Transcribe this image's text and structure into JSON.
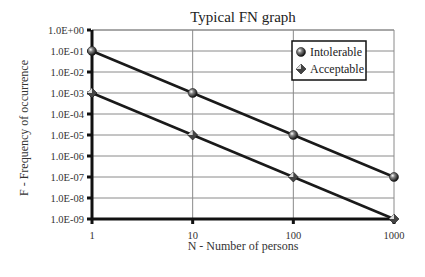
{
  "chart_data": {
    "type": "line",
    "title": "Typical FN graph",
    "xlabel": "N - Number of persons",
    "ylabel": "F - Frequency of occurrence",
    "x_scale": "log",
    "y_scale": "log",
    "x": [
      1,
      10,
      100,
      1000
    ],
    "x_tick_labels": [
      "1",
      "10",
      "100",
      "1000"
    ],
    "y_tick_labels": [
      "1.0E+00",
      "1.0E-01",
      "1.0E-02",
      "1.0E-03",
      "1.0E-04",
      "1.0E-05",
      "1.0E-06",
      "1.0E-07",
      "1.0E-08",
      "1.0E-09"
    ],
    "xlim": [
      1,
      1000
    ],
    "ylim": [
      1e-09,
      1
    ],
    "grid": true,
    "legend_position": "upper right (inside plot)",
    "series": [
      {
        "name": "Intolerable",
        "marker": "sphere",
        "values": [
          0.1,
          0.001,
          1e-05,
          1e-07
        ]
      },
      {
        "name": "Acceptable",
        "marker": "diamond",
        "values": [
          0.001,
          1e-05,
          1e-07,
          1e-09
        ]
      }
    ]
  },
  "colors": {
    "line": "#1a1a1a",
    "grid": "#8a8a8a",
    "axis": "#111111",
    "background": "#ffffff"
  }
}
